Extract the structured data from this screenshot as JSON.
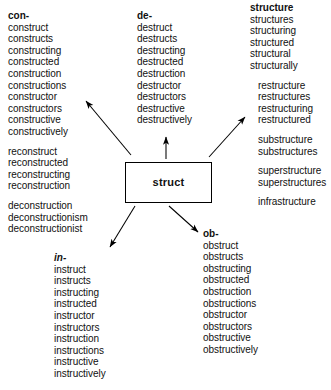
{
  "diagram": {
    "center": {
      "label": "struct"
    },
    "columns": [
      {
        "id": "con",
        "heading": "con-",
        "heading_style": "bold",
        "groups": [
          {
            "indent": false,
            "words": [
              "construct",
              "constructs",
              "constructing",
              "constructed",
              "construction",
              "constructions",
              "constructor",
              "constructors",
              "constructive",
              "constructively"
            ]
          },
          {
            "indent": false,
            "words": [
              "reconstruct",
              "reconstructed",
              "reconstructing",
              "reconstruction"
            ]
          },
          {
            "indent": false,
            "words": [
              "deconstruction",
              "deconstructionism",
              "deconstructionist"
            ]
          }
        ]
      },
      {
        "id": "de",
        "heading": "de-",
        "heading_style": "bold",
        "groups": [
          {
            "indent": false,
            "words": [
              "destruct",
              "destructs",
              "destructing",
              "destructed",
              "destruction",
              "destructor",
              "destructors",
              "destructive",
              "destructively"
            ]
          }
        ]
      },
      {
        "id": "structure",
        "heading": "structure",
        "heading_style": "bold",
        "groups": [
          {
            "indent": false,
            "words": [
              "structures",
              "structuring",
              "structured",
              "structural",
              "structurally"
            ]
          },
          {
            "indent": true,
            "words": [
              "restructure",
              "restructures",
              "restructuring",
              "restructured"
            ]
          },
          {
            "indent": true,
            "words": [
              "substructure",
              "substructures"
            ]
          },
          {
            "indent": true,
            "words": [
              "superstructure",
              "superstructures"
            ]
          },
          {
            "indent": true,
            "words": [
              "infrastructure"
            ]
          }
        ]
      },
      {
        "id": "in",
        "heading": "in-",
        "heading_style": "bold-italic",
        "groups": [
          {
            "indent": false,
            "words": [
              "instruct",
              "instructs",
              "instructing",
              "instructed",
              "instructor",
              "instructors",
              "instruction",
              "instructions",
              "instructive",
              "instructively"
            ]
          }
        ]
      },
      {
        "id": "ob",
        "heading": "ob-",
        "heading_style": "bold",
        "groups": [
          {
            "indent": false,
            "words": [
              "obstruct",
              "obstructs",
              "obstructing",
              "obstructed",
              "obstruction",
              "obstructions",
              "obstructor",
              "obstructors",
              "obstructive",
              "obstructively"
            ]
          }
        ]
      }
    ],
    "arrows": [
      {
        "name": "arrow-to-con",
        "from": "struct",
        "to": "con"
      },
      {
        "name": "arrow-to-de",
        "from": "struct",
        "to": "de"
      },
      {
        "name": "arrow-to-structure",
        "from": "struct",
        "to": "structure"
      },
      {
        "name": "arrow-to-in",
        "from": "struct",
        "to": "in"
      },
      {
        "name": "arrow-to-ob",
        "from": "struct",
        "to": "ob"
      }
    ]
  }
}
